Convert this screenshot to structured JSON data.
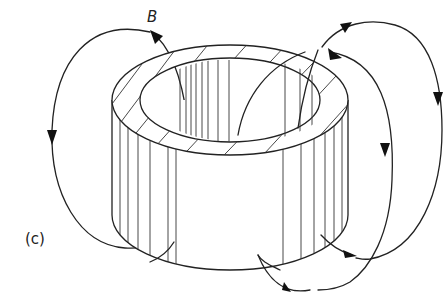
{
  "figure": {
    "type": "magnetic field lines around a toroidal core (cylindrical ring)",
    "labels": {
      "field": "B",
      "panel": "(c)"
    },
    "colors": {
      "line": "#222222",
      "background": "#ffffff"
    },
    "elements": [
      "toroid-cylinder with hatched top face",
      "left outer field loop (arrows downward on left, returning at bottom)",
      "right inner field loop (arrow downward)",
      "right outer field loop (arrow downward)",
      "bottom field loops with arrowheads pointing left"
    ]
  }
}
